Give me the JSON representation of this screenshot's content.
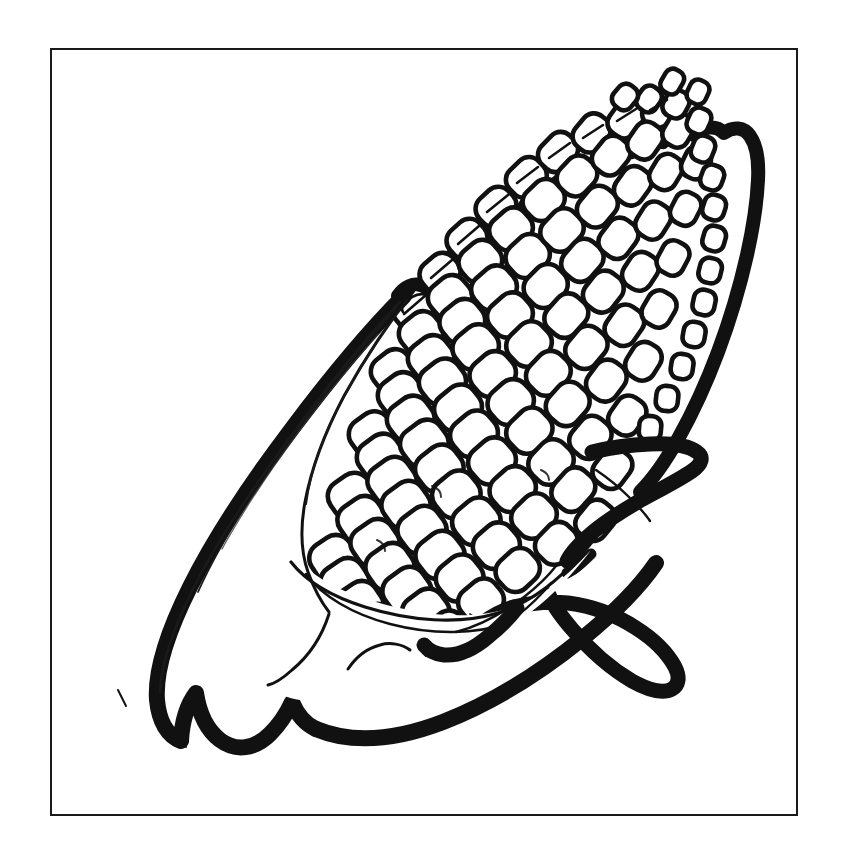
{
  "page": {
    "width": 846,
    "height": 867,
    "background_color": "#ffffff"
  },
  "colors": {
    "ink": "#111111",
    "paper": "#ffffff",
    "frame_stroke": "#1a1a1a",
    "thin_line": "#1a1a1a"
  },
  "frame": {
    "name": "border-frame",
    "x": 51,
    "y": 49,
    "width": 746,
    "height": 766,
    "stroke_width": 2,
    "fill": "none"
  },
  "artwork": {
    "subject": "corn-on-the-cob",
    "style": "ink line art / coloring book",
    "stroke_weight_outer": 15,
    "stroke_weight_inner": 3,
    "stroke_weight_detail": 1.6,
    "parts": [
      {
        "name": "corn-cob",
        "label": "Corn cob with kernels",
        "orientation": "diagonal, tip pointing upper-right",
        "kernel_count_approx": 150,
        "kernel_shape": "rounded square",
        "kernel_rows": 13
      },
      {
        "name": "husk-leaf-left",
        "label": "Large back husk leaf (lower-left)"
      },
      {
        "name": "husk-leaf-front",
        "label": "Front husk leaf folding over the cob"
      },
      {
        "name": "husk-leaf-right",
        "label": "Pointed husk leaf extending right"
      },
      {
        "name": "husk-leaf-bottom",
        "label": "Bottom husk leaf with pointed tip"
      },
      {
        "name": "silk-marks",
        "label": "Small oval highlight marks on edge kernels",
        "count": 9
      }
    ]
  }
}
